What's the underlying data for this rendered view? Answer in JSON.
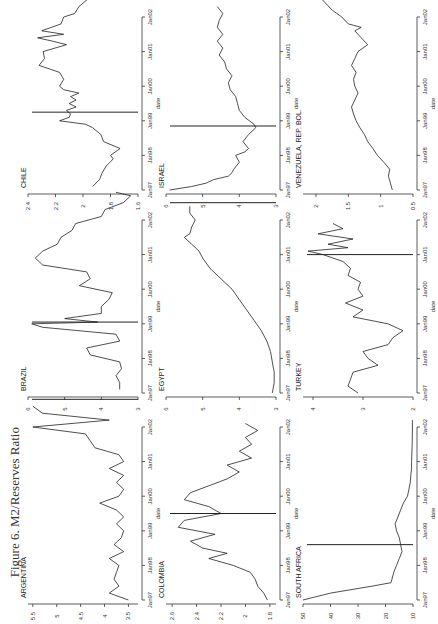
{
  "figure": {
    "title": "Figure 6.  M2/Reserves Ratio"
  },
  "chart_data": [
    {
      "type": "line",
      "title": "CHILE",
      "xlabel": "date",
      "ylabel": "",
      "ylim": [
        1.6,
        2.4
      ],
      "yticks": [
        2.4,
        2.2,
        2,
        1.8,
        1.6
      ],
      "xticks": [
        "Jan97",
        "Jan98",
        "Jan99",
        "Jan00",
        "Jan01",
        "Jan02"
      ],
      "grid": false,
      "row": 0,
      "col": 0,
      "event_t": 2.25,
      "points": [
        [
          0.1,
          1.93
        ],
        [
          0.3,
          1.88
        ],
        [
          0.5,
          1.86
        ],
        [
          0.7,
          1.83
        ],
        [
          0.9,
          1.78
        ],
        [
          1.0,
          1.8
        ],
        [
          1.2,
          1.73
        ],
        [
          1.4,
          1.85
        ],
        [
          1.6,
          1.87
        ],
        [
          1.8,
          1.93
        ],
        [
          1.9,
          1.98
        ],
        [
          2.0,
          2.17
        ],
        [
          2.1,
          2.1
        ],
        [
          2.2,
          2.09
        ],
        [
          2.3,
          2.12
        ],
        [
          2.4,
          2.05
        ],
        [
          2.5,
          2.1
        ],
        [
          2.6,
          2.05
        ],
        [
          2.7,
          2.09
        ],
        [
          2.8,
          2.03
        ],
        [
          2.9,
          2.14
        ],
        [
          3.0,
          2.17
        ],
        [
          3.2,
          2.14
        ],
        [
          3.4,
          2.17
        ],
        [
          3.6,
          2.32
        ],
        [
          3.8,
          2.28
        ],
        [
          4.0,
          2.29
        ],
        [
          4.2,
          2.12
        ],
        [
          4.3,
          2.22
        ],
        [
          4.4,
          2.33
        ],
        [
          4.5,
          2.14
        ],
        [
          4.6,
          2.3
        ],
        [
          4.8,
          2.16
        ],
        [
          5.0,
          2.14
        ],
        [
          5.1,
          2.06
        ],
        [
          5.3,
          2.03
        ],
        [
          5.5,
          1.97
        ],
        [
          5.6,
          1.98
        ],
        [
          5.7,
          1.92
        ],
        [
          5.8,
          1.96
        ]
      ]
    },
    {
      "type": "line",
      "title": "ISRAEL",
      "xlabel": "date",
      "ylabel": "",
      "ylim": [
        3,
        6
      ],
      "yticks": [
        6,
        5,
        4,
        3
      ],
      "xticks": [
        "Jan97",
        "Jan98",
        "Jan99",
        "Jan00",
        "Jan01",
        "Jan02"
      ],
      "grid": false,
      "row": 0,
      "col": 1,
      "event_t": 1.85,
      "points": [
        [
          0.0,
          5.9
        ],
        [
          0.1,
          5.3
        ],
        [
          0.2,
          4.9
        ],
        [
          0.3,
          4.7
        ],
        [
          0.4,
          4.3
        ],
        [
          0.5,
          4.2
        ],
        [
          0.6,
          4.15
        ],
        [
          0.8,
          4.0
        ],
        [
          1.0,
          4.1
        ],
        [
          1.1,
          3.85
        ],
        [
          1.2,
          3.75
        ],
        [
          1.4,
          3.9
        ],
        [
          1.6,
          3.75
        ],
        [
          1.8,
          3.55
        ],
        [
          1.9,
          3.6
        ],
        [
          2.1,
          3.85
        ],
        [
          2.3,
          4.0
        ],
        [
          2.5,
          4.05
        ],
        [
          2.7,
          4.1
        ],
        [
          2.9,
          4.25
        ],
        [
          3.1,
          4.3
        ],
        [
          3.3,
          4.2
        ],
        [
          3.5,
          4.35
        ],
        [
          3.7,
          4.4
        ],
        [
          3.9,
          4.55
        ],
        [
          4.1,
          4.45
        ],
        [
          4.3,
          4.6
        ],
        [
          4.5,
          4.45
        ],
        [
          4.7,
          4.6
        ],
        [
          4.9,
          4.55
        ],
        [
          5.1,
          4.45
        ],
        [
          5.3,
          4.6
        ]
      ]
    },
    {
      "type": "line",
      "title": "VENEZUELA, REP. BOL.",
      "xlabel": "date",
      "ylabel": "",
      "ylim": [
        0.5,
        2.2
      ],
      "yticks": [
        2,
        1.5,
        1,
        0.5
      ],
      "xticks": [
        "Jan97",
        "Jan98",
        "Jan99",
        "Jan00",
        "Jan01",
        "Jan02"
      ],
      "grid": false,
      "row": 0,
      "col": 2,
      "event_t": 5.9,
      "points": [
        [
          0.0,
          0.82
        ],
        [
          0.2,
          0.85
        ],
        [
          0.4,
          0.88
        ],
        [
          0.6,
          0.86
        ],
        [
          0.8,
          0.95
        ],
        [
          1.0,
          1.05
        ],
        [
          1.2,
          1.12
        ],
        [
          1.4,
          1.2
        ],
        [
          1.6,
          1.25
        ],
        [
          1.8,
          1.32
        ],
        [
          2.0,
          1.38
        ],
        [
          2.2,
          1.42
        ],
        [
          2.4,
          1.45
        ],
        [
          2.6,
          1.4
        ],
        [
          2.8,
          1.35
        ],
        [
          3.0,
          1.4
        ],
        [
          3.2,
          1.42
        ],
        [
          3.4,
          1.38
        ],
        [
          3.6,
          1.45
        ],
        [
          3.8,
          1.4
        ],
        [
          4.0,
          1.35
        ],
        [
          4.2,
          1.2
        ],
        [
          4.4,
          1.3
        ],
        [
          4.6,
          1.4
        ],
        [
          4.7,
          1.3
        ],
        [
          4.8,
          1.5
        ],
        [
          5.0,
          1.6
        ],
        [
          5.2,
          1.75
        ],
        [
          5.4,
          1.85
        ],
        [
          5.6,
          1.95
        ],
        [
          5.7,
          2.05
        ]
      ]
    },
    {
      "type": "line",
      "title": "BRAZIL",
      "xlabel": "date",
      "ylabel": "",
      "ylim": [
        3,
        6
      ],
      "yticks": [
        6,
        5,
        4,
        3
      ],
      "xticks": [
        "Jan97",
        "Jan98",
        "Jan99",
        "Jan00",
        "Jan01",
        "Jan02"
      ],
      "grid": false,
      "row": 1,
      "col": 0,
      "event_t": 2.05,
      "points": [
        [
          0.1,
          3.5
        ],
        [
          0.3,
          3.5
        ],
        [
          0.5,
          3.6
        ],
        [
          0.7,
          3.45
        ],
        [
          0.9,
          3.5
        ],
        [
          1.1,
          4.3
        ],
        [
          1.3,
          4.4
        ],
        [
          1.5,
          3.5
        ],
        [
          1.7,
          3.6
        ],
        [
          1.9,
          5.6
        ],
        [
          2.0,
          5.9
        ],
        [
          2.05,
          4.1
        ],
        [
          2.15,
          5.0
        ],
        [
          2.3,
          4.0
        ],
        [
          2.5,
          4.0
        ],
        [
          2.7,
          3.8
        ],
        [
          2.9,
          3.7
        ],
        [
          3.1,
          4.6
        ],
        [
          3.3,
          4.3
        ],
        [
          3.5,
          4.4
        ],
        [
          3.7,
          5.6
        ],
        [
          3.9,
          5.8
        ],
        [
          4.1,
          5.6
        ],
        [
          4.3,
          5.2
        ],
        [
          4.5,
          5.1
        ],
        [
          4.7,
          4.8
        ],
        [
          4.9,
          4.7
        ],
        [
          5.1,
          4.0
        ],
        [
          5.3,
          3.9
        ],
        [
          5.5,
          3.4
        ],
        [
          5.7,
          3.2
        ],
        [
          5.8,
          3.6
        ]
      ]
    },
    {
      "type": "line",
      "title": "EGYPT",
      "xlabel": "date",
      "ylabel": "",
      "ylim": [
        3,
        6
      ],
      "yticks": [
        6,
        5,
        4,
        3
      ],
      "xticks": [
        "Jan97",
        "Jan98",
        "Jan99",
        "Jan00",
        "Jan01",
        "Jan02"
      ],
      "grid": false,
      "row": 1,
      "col": 1,
      "event_t": 5.5,
      "points": [
        [
          0.0,
          3.1
        ],
        [
          0.3,
          3.05
        ],
        [
          0.6,
          3.05
        ],
        [
          0.9,
          3.1
        ],
        [
          1.2,
          3.15
        ],
        [
          1.5,
          3.25
        ],
        [
          1.8,
          3.4
        ],
        [
          2.1,
          3.6
        ],
        [
          2.4,
          3.8
        ],
        [
          2.7,
          4.0
        ],
        [
          3.0,
          4.2
        ],
        [
          3.3,
          4.5
        ],
        [
          3.6,
          4.8
        ],
        [
          3.9,
          5.0
        ],
        [
          4.1,
          5.1
        ],
        [
          4.3,
          5.3
        ],
        [
          4.5,
          5.5
        ],
        [
          4.6,
          5.35
        ],
        [
          4.8,
          5.3
        ],
        [
          5.0,
          5.2
        ],
        [
          5.2,
          5.35
        ],
        [
          5.4,
          5.35
        ]
      ]
    },
    {
      "type": "line",
      "title": "TURKEY",
      "xlabel": "date",
      "ylabel": "",
      "ylim": [
        2,
        4.2
      ],
      "yticks": [
        4,
        3,
        2
      ],
      "xticks": [
        "Jan97",
        "Jan98",
        "Jan99",
        "Jan00",
        "Jan01",
        "Jan02"
      ],
      "grid": false,
      "row": 1,
      "col": 2,
      "event_t": 4.0,
      "points": [
        [
          0.0,
          3.1
        ],
        [
          0.2,
          3.3
        ],
        [
          0.4,
          3.25
        ],
        [
          0.6,
          3.2
        ],
        [
          0.8,
          2.7
        ],
        [
          1.0,
          2.9
        ],
        [
          1.2,
          3.0
        ],
        [
          1.4,
          2.5
        ],
        [
          1.6,
          2.4
        ],
        [
          1.8,
          2.2
        ],
        [
          2.0,
          2.5
        ],
        [
          2.2,
          3.2
        ],
        [
          2.4,
          3.0
        ],
        [
          2.6,
          3.35
        ],
        [
          2.8,
          3.0
        ],
        [
          3.0,
          3.1
        ],
        [
          3.2,
          3.05
        ],
        [
          3.4,
          3.3
        ],
        [
          3.6,
          3.25
        ],
        [
          3.8,
          3.4
        ],
        [
          4.0,
          3.8
        ],
        [
          4.1,
          4.1
        ],
        [
          4.2,
          3.3
        ],
        [
          4.3,
          3.7
        ],
        [
          4.45,
          3.2
        ],
        [
          4.6,
          3.9
        ],
        [
          4.75,
          3.4
        ],
        [
          4.9,
          3.6
        ]
      ]
    },
    {
      "type": "line",
      "title": "ARGENTINA",
      "xlabel": "date",
      "ylabel": "",
      "ylim": [
        3.3,
        5.6
      ],
      "yticks": [
        5.5,
        5,
        4.5,
        4,
        3.5
      ],
      "xticks": [
        "Jan97",
        "Jan98",
        "Jan99",
        "Jan00",
        "Jan01",
        "Jan02"
      ],
      "grid": false,
      "row": 2,
      "col": 0,
      "event_t": 5.8,
      "points": [
        [
          0.0,
          3.5
        ],
        [
          0.2,
          3.9
        ],
        [
          0.4,
          3.7
        ],
        [
          0.6,
          3.8
        ],
        [
          0.8,
          3.75
        ],
        [
          1.0,
          3.7
        ],
        [
          1.2,
          3.9
        ],
        [
          1.4,
          3.6
        ],
        [
          1.6,
          3.8
        ],
        [
          1.8,
          3.65
        ],
        [
          2.0,
          3.6
        ],
        [
          2.2,
          3.75
        ],
        [
          2.4,
          3.6
        ],
        [
          2.6,
          3.75
        ],
        [
          2.8,
          4.1
        ],
        [
          3.0,
          3.7
        ],
        [
          3.2,
          3.6
        ],
        [
          3.4,
          3.75
        ],
        [
          3.6,
          3.6
        ],
        [
          3.8,
          3.9
        ],
        [
          4.0,
          3.6
        ],
        [
          4.2,
          3.7
        ],
        [
          4.4,
          4.2
        ],
        [
          4.6,
          4.3
        ],
        [
          4.8,
          4.4
        ],
        [
          5.0,
          5.5
        ],
        [
          5.2,
          3.9
        ],
        [
          5.4,
          5.3
        ],
        [
          5.6,
          5.5
        ]
      ]
    },
    {
      "type": "line",
      "title": "COLOMBIA",
      "xlabel": "date",
      "ylabel": "",
      "ylim": [
        1.75,
        2.65
      ],
      "yticks": [
        2.6,
        2.4,
        2.2,
        2,
        1.8
      ],
      "xticks": [
        "Jan97",
        "Jan98",
        "Jan99",
        "Jan00",
        "Jan01",
        "Jan02"
      ],
      "grid": false,
      "row": 2,
      "col": 1,
      "event_t": 2.5,
      "points": [
        [
          0.0,
          1.82
        ],
        [
          0.2,
          1.85
        ],
        [
          0.4,
          1.9
        ],
        [
          0.6,
          1.92
        ],
        [
          0.8,
          1.96
        ],
        [
          1.0,
          2.1
        ],
        [
          1.2,
          2.3
        ],
        [
          1.35,
          2.15
        ],
        [
          1.5,
          2.35
        ],
        [
          1.7,
          2.45
        ],
        [
          1.9,
          2.25
        ],
        [
          2.1,
          2.55
        ],
        [
          2.3,
          2.5
        ],
        [
          2.5,
          2.2
        ],
        [
          2.7,
          2.3
        ],
        [
          2.9,
          2.5
        ],
        [
          3.1,
          2.45
        ],
        [
          3.3,
          2.3
        ],
        [
          3.5,
          2.15
        ],
        [
          3.7,
          2.05
        ],
        [
          3.9,
          2.15
        ],
        [
          4.1,
          1.95
        ],
        [
          4.3,
          2.05
        ],
        [
          4.5,
          1.95
        ],
        [
          4.7,
          2.0
        ],
        [
          4.9,
          1.9
        ],
        [
          5.1,
          2.0
        ]
      ]
    },
    {
      "type": "line",
      "title": "SOUTH AFRICA",
      "xlabel": "date",
      "ylabel": "",
      "ylim": [
        10,
        50
      ],
      "yticks": [
        50,
        40,
        30,
        20,
        10
      ],
      "xticks": [
        "Jan97",
        "Jan98",
        "Jan99",
        "Jan00",
        "Jan01",
        "Jan02"
      ],
      "grid": false,
      "row": 2,
      "col": 2,
      "event_t": 1.6,
      "points": [
        [
          0.0,
          50
        ],
        [
          0.2,
          40
        ],
        [
          0.4,
          25
        ],
        [
          0.5,
          18
        ],
        [
          0.8,
          17
        ],
        [
          1.0,
          16
        ],
        [
          1.2,
          15
        ],
        [
          1.4,
          14
        ],
        [
          1.6,
          14.5
        ],
        [
          1.8,
          15
        ],
        [
          2.0,
          16
        ],
        [
          2.2,
          16.5
        ],
        [
          2.4,
          15.5
        ],
        [
          2.6,
          14.5
        ],
        [
          2.8,
          13.5
        ],
        [
          3.0,
          12
        ],
        [
          3.2,
          11.5
        ],
        [
          3.4,
          11
        ],
        [
          3.6,
          10.8
        ],
        [
          3.8,
          10.5
        ],
        [
          4.0,
          10.5
        ],
        [
          4.5,
          10.3
        ],
        [
          5.0,
          10.2
        ],
        [
          5.2,
          10.2
        ]
      ]
    }
  ]
}
